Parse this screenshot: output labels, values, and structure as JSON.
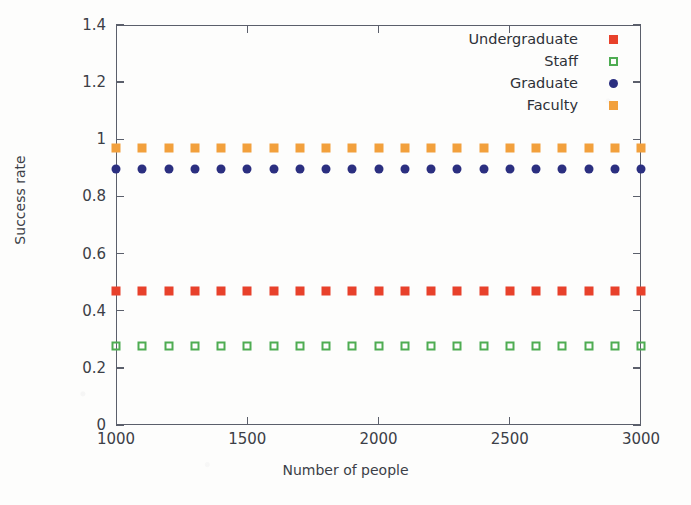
{
  "chart_data": {
    "type": "scatter",
    "title": "",
    "xlabel": "Number of people",
    "ylabel": "Success rate",
    "xlim": [
      1000,
      3000
    ],
    "ylim": [
      0,
      1.4
    ],
    "grid": false,
    "legend_position": "top-right",
    "x": [
      1000,
      1100,
      1200,
      1300,
      1400,
      1500,
      1600,
      1700,
      1800,
      1900,
      2000,
      2100,
      2200,
      2300,
      2400,
      2500,
      2600,
      2700,
      2800,
      2900,
      3000
    ],
    "xticks": [
      1000,
      1500,
      2000,
      2500,
      3000
    ],
    "xtick_labels": [
      "1000",
      "1500",
      "2000",
      "2500",
      "3000"
    ],
    "yticks": [
      0,
      0.2,
      0.4,
      0.6,
      0.8,
      1,
      1.2,
      1.4
    ],
    "ytick_labels": [
      "0",
      "0.2",
      "0.4",
      "0.6",
      "0.8",
      "1",
      "1.2",
      "1.4"
    ],
    "series": [
      {
        "name": "Undergraduate",
        "color": "#e8412b",
        "marker": "filled-square",
        "values": [
          0.47,
          0.47,
          0.47,
          0.47,
          0.47,
          0.47,
          0.47,
          0.47,
          0.47,
          0.47,
          0.47,
          0.47,
          0.47,
          0.47,
          0.47,
          0.47,
          0.47,
          0.47,
          0.47,
          0.47,
          0.47
        ]
      },
      {
        "name": "Staff",
        "color": "#4eac52",
        "marker": "open-square",
        "values": [
          0.276,
          0.276,
          0.276,
          0.276,
          0.276,
          0.276,
          0.276,
          0.276,
          0.276,
          0.276,
          0.276,
          0.276,
          0.276,
          0.276,
          0.276,
          0.276,
          0.276,
          0.276,
          0.276,
          0.276,
          0.276
        ]
      },
      {
        "name": "Graduate",
        "color": "#2b2f80",
        "marker": "filled-circle",
        "values": [
          0.895,
          0.895,
          0.895,
          0.895,
          0.895,
          0.895,
          0.895,
          0.895,
          0.895,
          0.895,
          0.895,
          0.895,
          0.895,
          0.895,
          0.895,
          0.895,
          0.895,
          0.895,
          0.895,
          0.895,
          0.895
        ]
      },
      {
        "name": "Faculty",
        "color": "#f2a03c",
        "marker": "filled-square",
        "values": [
          0.968,
          0.968,
          0.968,
          0.968,
          0.968,
          0.968,
          0.968,
          0.968,
          0.968,
          0.968,
          0.968,
          0.968,
          0.968,
          0.968,
          0.968,
          0.968,
          0.968,
          0.968,
          0.968,
          0.968,
          0.968
        ]
      }
    ]
  },
  "legend": {
    "entries": [
      {
        "label": "Undergraduate"
      },
      {
        "label": "Staff"
      },
      {
        "label": "Graduate"
      },
      {
        "label": "Faculty"
      }
    ]
  },
  "axes": {
    "x_title": "Number of people",
    "y_title": "Success rate"
  },
  "colors": {
    "axis": "#5b5f6b",
    "text": "#3c3f47",
    "background": "#fdfdfc"
  }
}
